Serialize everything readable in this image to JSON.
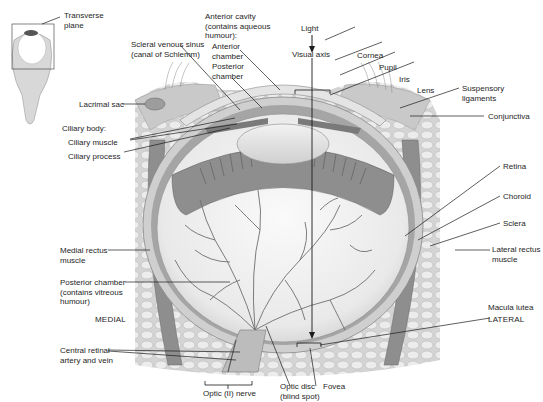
{
  "diagram": {
    "inset": {
      "label": "Transverse\nplane"
    },
    "labels": {
      "transverse_plane": "Transverse\nplane",
      "scleral_venous_sinus": "Scleral venous sinus\n(canal of Schlemm)",
      "anterior_cavity": "Anterior cavity\n(contains aqueous\nhumour):",
      "anterior_chamber": "Anterior\nchamber",
      "posterior_chamber_front": "Posterior\nchamber",
      "light": "Light",
      "visual_axis": "Visual axis",
      "cornea": "Cornea",
      "pupil": "Pupil",
      "iris": "Iris",
      "lens": "Lens",
      "suspensory_ligaments": "Suspensory\nligaments",
      "conjunctiva": "Conjunctiva",
      "lacrimal_sac": "Lacrimal sac",
      "ciliary_body": "Ciliary body:",
      "ciliary_muscle": "Ciliary muscle",
      "ciliary_process": "Ciliary process",
      "retina": "Retina",
      "choroid": "Choroid",
      "sclera": "Sclera",
      "lateral_rectus": "Lateral rectus\nmuscle",
      "medial_rectus": "Medial rectus\nmuscle",
      "posterior_chamber_vitreous": "Posterior chamber\n(contains vitreous\nhumour)",
      "medial": "MEDIAL",
      "lateral": "LATERAL",
      "macula_lutea": "Macula lutea",
      "central_retinal": "Central retinal\nartery and vein",
      "optic_nerve": "Optic (II) nerve",
      "optic_disc": "Optic disc\n(blind spot)",
      "fovea": "Fovea"
    },
    "colors": {
      "leader_line": "#1a1a1a",
      "tissue_light": "#d9d9d9",
      "tissue_mid": "#a8a8a8",
      "tissue_dark": "#5a5a5a",
      "vitreous": "#f4f4f4"
    }
  }
}
